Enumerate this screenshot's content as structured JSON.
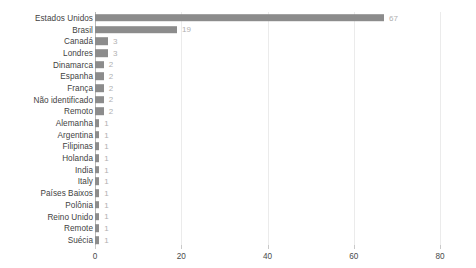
{
  "chart_data": {
    "type": "bar",
    "orientation": "horizontal",
    "title": "",
    "xlabel": "",
    "ylabel": "",
    "xlim": [
      0,
      80
    ],
    "xticks": [
      0,
      20,
      40,
      60,
      80
    ],
    "grid": true,
    "legend": false,
    "bar_color": "#8c8c8c",
    "value_label_color": "#b0b0b0",
    "background": "#ffffff",
    "categories": [
      "Estados Unidos",
      "Brasil",
      "Canadá",
      "Londres",
      "Dinamarca",
      "Espanha",
      "França",
      "Não identificado",
      "Remoto",
      "Alemanha",
      "Argentina",
      "Filipinas",
      "Holanda",
      "India",
      "Italy",
      "Países Baixos",
      "Polônia",
      "Reino Unido",
      "Remote",
      "Suécia"
    ],
    "values": [
      67,
      19,
      3,
      3,
      2,
      2,
      2,
      2,
      2,
      1,
      1,
      1,
      1,
      1,
      1,
      1,
      1,
      1,
      1,
      1
    ],
    "value_labels": [
      "67",
      "19",
      "3",
      "3",
      "2",
      "2",
      "2",
      "2",
      "2",
      "1",
      "1",
      "1",
      "1",
      "1",
      "1",
      "1",
      "1",
      "1",
      "1",
      "1"
    ],
    "xtick_labels": [
      "0",
      "20",
      "40",
      "60",
      "80"
    ]
  }
}
